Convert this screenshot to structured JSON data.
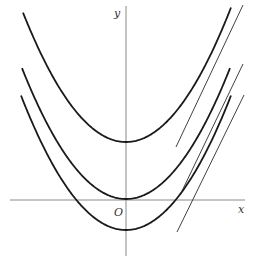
{
  "figure": {
    "axes": {
      "x_label": "x",
      "y_label": "y",
      "origin_label": "O"
    }
  },
  "chart_data": {
    "type": "line",
    "title": "",
    "xlabel": "x",
    "ylabel": "y",
    "origin_label": "O",
    "grid": false,
    "pixel_frame": {
      "origin_px": [
        126,
        200
      ],
      "x_axis_px": [
        10,
        245
      ],
      "y_axis_px": [
        6,
        256
      ]
    },
    "series": [
      {
        "name": "upper parabola",
        "vertex_px": [
          126,
          142
        ],
        "k": 0.0122,
        "x_range_px": [
          23,
          231
        ]
      },
      {
        "name": "middle parabola (through O)",
        "vertex_px": [
          126,
          199
        ],
        "k": 0.0121,
        "x_range_px": [
          22,
          230
        ]
      },
      {
        "name": "lower parabola",
        "vertex_px": [
          126,
          230
        ],
        "k": 0.0122,
        "x_range_px": [
          21,
          231
        ]
      }
    ],
    "tangents": [
      {
        "name": "tangent to upper parabola",
        "from_px": [
          176,
          147
        ],
        "to_px": [
          243,
          5
        ]
      },
      {
        "name": "tangent to middle parabola",
        "from_px": [
          182,
          191
        ],
        "to_px": [
          243,
          64
        ]
      },
      {
        "name": "tangent to lower parabola",
        "from_px": [
          177,
          232
        ],
        "to_px": [
          244,
          95
        ]
      }
    ]
  }
}
